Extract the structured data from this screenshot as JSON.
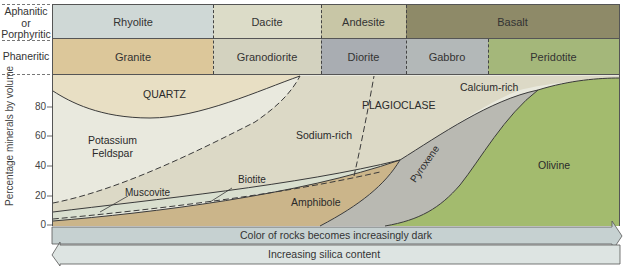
{
  "rows": {
    "aphanitic": {
      "label_line1": "Aphanitic",
      "label_line2": "or",
      "label_line3": "Porphyritic",
      "rocks": [
        {
          "name": "Rhyolite",
          "color": "#cfd8d6"
        },
        {
          "name": "Dacite",
          "color": "#dcdcc8"
        },
        {
          "name": "Andesite",
          "color": "#c8c6a6"
        },
        {
          "name": "Basalt",
          "color": "#8e8a68"
        }
      ]
    },
    "phaneritic": {
      "label": "Phaneritic",
      "rocks": [
        {
          "name": "Granite",
          "color": "#dcc79a"
        },
        {
          "name": "Granodiorite",
          "color": "#d3d2bf"
        },
        {
          "name": "Diorite",
          "color": "#a9adb2"
        },
        {
          "name": "Gabbro",
          "color": "#b3b8b8"
        },
        {
          "name": "Peridotite",
          "color": "#a4b77a"
        }
      ]
    }
  },
  "plot": {
    "y_axis_label": "Percentage minerals by volume",
    "y_ticks": [
      "0",
      "20",
      "40",
      "60",
      "80"
    ],
    "minerals": {
      "quartz": "QUARTZ",
      "potassium_feldspar_line1": "Potassium",
      "potassium_feldspar_line2": "Feldspar",
      "plagioclase": "PLAGIOCLASE",
      "sodium_rich": "Sodium-rich",
      "calcium_rich": "Calcium-rich",
      "muscovite": "Muscovite",
      "biotite": "Biotite",
      "amphibole": "Amphibole",
      "pyroxene": "Pyroxene",
      "olivine": "Olivine"
    },
    "colors": {
      "quartz": "#e8dfc4",
      "potassium_feldspar": "#e9e9de",
      "plagioclase": "#dcd9c6",
      "muscovite_biotite": "#d9dfcf",
      "amphibole": "#cbb58a",
      "pyroxene": "#b9b9b2",
      "olivine": "#a3bb6e"
    }
  },
  "arrows": {
    "color_arrow": "Color of rocks becomes increasingly dark",
    "silica_arrow": "Increasing silica content"
  }
}
